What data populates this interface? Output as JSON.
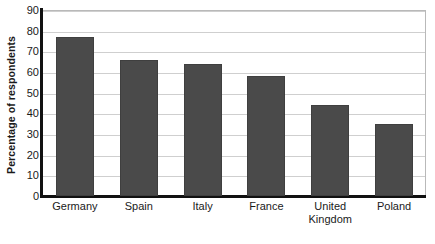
{
  "chart_data": {
    "type": "bar",
    "title": "",
    "subtitle": "",
    "xlabel": "",
    "ylabel": "Percentage of respondents",
    "categories": [
      "Germany",
      "Spain",
      "Italy",
      "France",
      "United\nKingdom",
      "Poland"
    ],
    "values": [
      77,
      66,
      64,
      58,
      44,
      35
    ],
    "ylim": [
      0,
      90
    ],
    "ytick_labels": [
      "90",
      "80",
      "70",
      "60",
      "50",
      "40",
      "30",
      "20",
      "10",
      "0"
    ],
    "ytick_values": [
      90,
      80,
      70,
      60,
      50,
      40,
      30,
      20,
      10,
      0
    ],
    "ytick_step": 10,
    "grid": "horizontal",
    "legend": "none",
    "series": [
      {
        "name": "Percentage of respondents",
        "values": [
          77,
          66,
          64,
          58,
          44,
          35
        ],
        "color": "#4a4a4a"
      }
    ],
    "colors": {
      "bar": "#4a4a4a",
      "bar_border": "#3f3f3f",
      "gridline": "#cfcfcf",
      "axis": "#111111",
      "plot_border": "#b9b9b9",
      "background": "#ffffff",
      "text": "#1a1a1a"
    }
  }
}
